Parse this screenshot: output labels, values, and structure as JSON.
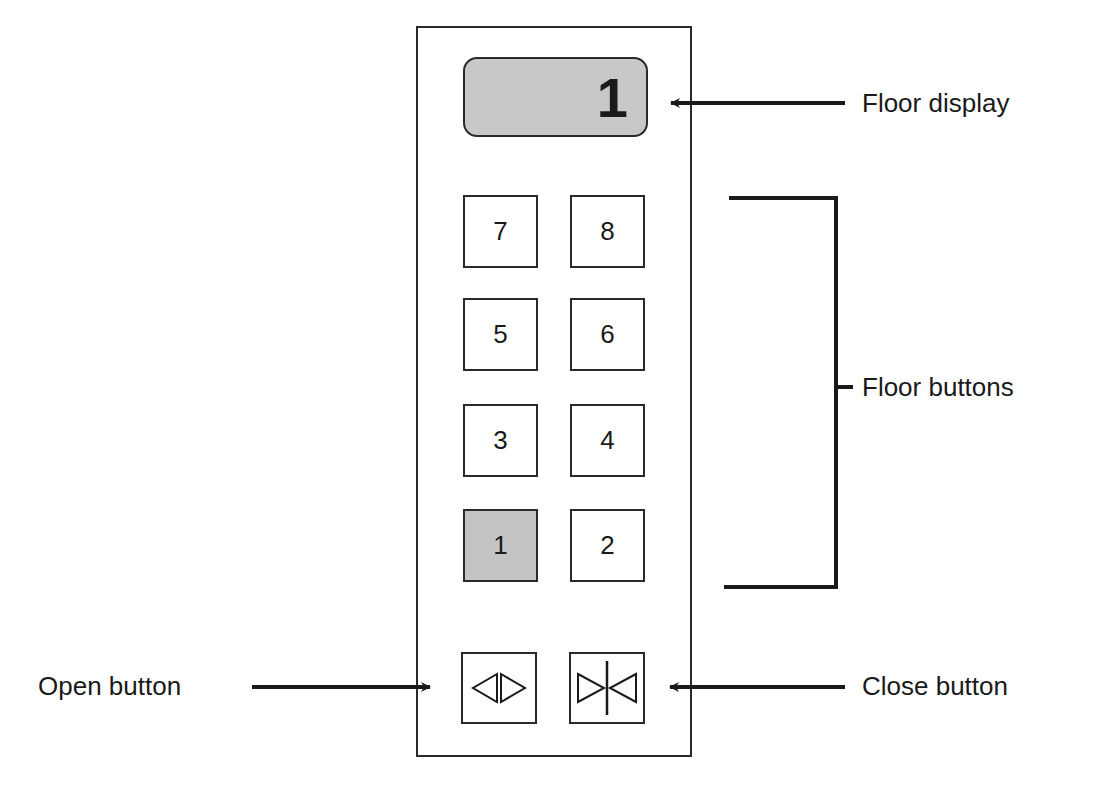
{
  "panel": {
    "display": {
      "value": "1"
    },
    "floor_buttons": [
      {
        "label": "7",
        "lit": false
      },
      {
        "label": "8",
        "lit": false
      },
      {
        "label": "5",
        "lit": false
      },
      {
        "label": "6",
        "lit": false
      },
      {
        "label": "3",
        "lit": false
      },
      {
        "label": "4",
        "lit": false
      },
      {
        "label": "1",
        "lit": true
      },
      {
        "label": "2",
        "lit": false
      }
    ],
    "door_buttons": [
      {
        "name": "open",
        "icon": "door-open-icon"
      },
      {
        "name": "close",
        "icon": "door-close-icon"
      }
    ]
  },
  "annotations": {
    "floor_display": "Floor display",
    "floor_buttons": "Floor buttons",
    "open_button": "Open button",
    "close_button": "Close button"
  },
  "colors": {
    "line": "#1a1a1a",
    "lit_fill": "#c4c4c4",
    "display_fill": "#c8c8c8"
  }
}
